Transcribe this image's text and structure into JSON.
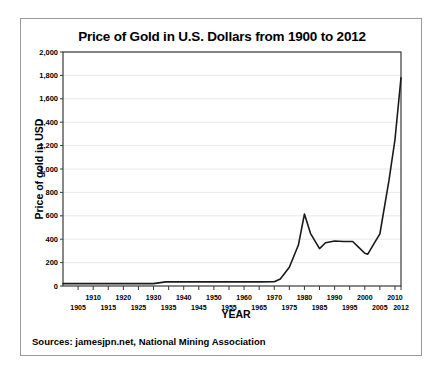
{
  "figure": {
    "title": "Price of Gold in U.S. Dollars from 1900 to 2012",
    "sources": "Sources: jamesjpn.net, National Mining Association",
    "xaxis_title": "YEAR",
    "yaxis_title": "Price of gold in USD"
  },
  "chart_data": {
    "type": "line",
    "title": "Price of Gold in U.S. Dollars from 1900 to 2012",
    "xlabel": "YEAR",
    "ylabel": "Price of gold in USD",
    "xlim": [
      1900,
      2012
    ],
    "ylim": [
      0,
      2000
    ],
    "grid": true,
    "legend": false,
    "line_color": "#1a1a1a",
    "ytick_labels": [
      "0",
      "200",
      "400",
      "600",
      "800",
      "1,000",
      "1,200",
      "1,400",
      "1,600",
      "1,800",
      "2,000"
    ],
    "ytick_values": [
      0,
      200,
      400,
      600,
      800,
      1000,
      1200,
      1400,
      1600,
      1800,
      2000
    ],
    "xtick_upper_labels": [
      "1910",
      "1920",
      "1930",
      "1940",
      "1950",
      "1960",
      "1970",
      "1980",
      "1990",
      "2000",
      "2010"
    ],
    "xtick_upper_values": [
      1910,
      1920,
      1930,
      1940,
      1950,
      1960,
      1970,
      1980,
      1990,
      2000,
      2010
    ],
    "xtick_lower_labels": [
      "1905",
      "1915",
      "1925",
      "1935",
      "1945",
      "1955",
      "1965",
      "1975",
      "1985",
      "1995",
      "2005",
      "2012"
    ],
    "xtick_lower_values": [
      1905,
      1915,
      1925,
      1935,
      1945,
      1955,
      1965,
      1975,
      1985,
      1995,
      2005,
      2012
    ],
    "x": [
      1900,
      1905,
      1910,
      1915,
      1920,
      1925,
      1930,
      1934,
      1940,
      1945,
      1950,
      1955,
      1960,
      1965,
      1970,
      1972,
      1975,
      1978,
      1980,
      1982,
      1985,
      1987,
      1990,
      1993,
      1996,
      1998,
      2000,
      2001,
      2003,
      2005,
      2008,
      2010,
      2012
    ],
    "values": [
      20,
      20,
      20,
      20,
      20,
      20,
      20,
      35,
      35,
      35,
      35,
      35,
      35,
      35,
      36,
      60,
      160,
      350,
      615,
      450,
      320,
      370,
      385,
      380,
      380,
      330,
      280,
      272,
      360,
      445,
      900,
      1250,
      1780
    ],
    "series": [
      {
        "name": "Price of gold in USD",
        "values": [
          20,
          20,
          20,
          20,
          20,
          20,
          20,
          35,
          35,
          35,
          35,
          35,
          35,
          35,
          36,
          60,
          160,
          350,
          615,
          450,
          320,
          370,
          385,
          380,
          380,
          330,
          280,
          272,
          360,
          445,
          900,
          1250,
          1780
        ]
      }
    ]
  }
}
